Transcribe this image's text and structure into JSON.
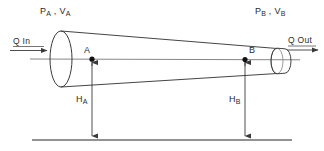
{
  "diagram": {
    "type": "engineering-schematic",
    "colors": {
      "line": "#3a3a3a",
      "centerline": "#6e6e6e",
      "datum": "#6e6e6e",
      "text": "#2b2b2b",
      "point": "#111111",
      "background": "#ffffff"
    },
    "labels": {
      "left_state": {
        "pressure": "P",
        "pressure_sub": "A",
        "separator": " , ",
        "velocity": "V",
        "velocity_sub": "A"
      },
      "right_state": {
        "pressure": "P",
        "pressure_sub": "B",
        "separator": " , ",
        "velocity": "V",
        "velocity_sub": "B"
      },
      "inlet": "Q  In",
      "outlet": "Q  Out",
      "point_a": "A",
      "point_b": "B",
      "head_a": "H",
      "head_a_sub": "A",
      "head_b": "H",
      "head_b_sub": "B"
    },
    "geometry": {
      "centerline_y": 59,
      "datum_y": 140,
      "inlet_ellipse": {
        "cx": 61,
        "cy": 59,
        "rx": 11,
        "ry": 28
      },
      "outlet_ellipse": {
        "cx": 277,
        "cy": 61,
        "rx": 6,
        "ry": 13
      },
      "point_a": {
        "x": 92,
        "y": 59
      },
      "point_b": {
        "x": 245,
        "y": 59
      },
      "datum_x_start": 32,
      "datum_x_end": 292
    }
  }
}
